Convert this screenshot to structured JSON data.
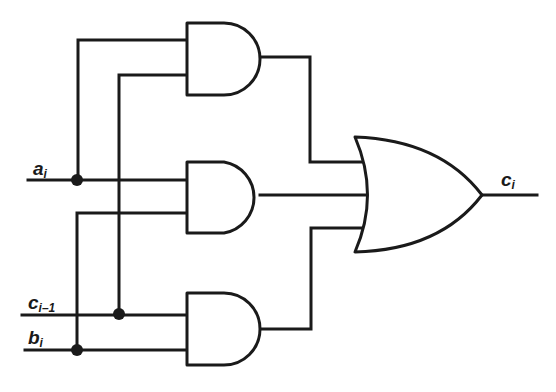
{
  "diagram": {
    "stroke_color": "#1a1a1a",
    "background": "#ffffff",
    "inputs": [
      {
        "id": "a",
        "label": "a",
        "subscript": "i"
      },
      {
        "id": "cin",
        "label": "c",
        "subscript": "i–1"
      },
      {
        "id": "b",
        "label": "b",
        "subscript": "i"
      }
    ],
    "output": {
      "id": "c",
      "label": "c",
      "subscript": "i"
    },
    "gates": [
      {
        "id": "and1",
        "type": "AND",
        "inputs": [
          "a",
          "cin"
        ]
      },
      {
        "id": "and2",
        "type": "AND",
        "inputs": [
          "a",
          "b"
        ]
      },
      {
        "id": "and3",
        "type": "AND",
        "inputs": [
          "cin",
          "b"
        ]
      },
      {
        "id": "or1",
        "type": "OR",
        "inputs": [
          "and1",
          "and2",
          "and3"
        ],
        "output": "c"
      }
    ],
    "junctions": [
      {
        "wire": "a",
        "count": 1
      },
      {
        "wire": "cin",
        "count": 1
      },
      {
        "wire": "b",
        "count": 1
      }
    ]
  }
}
